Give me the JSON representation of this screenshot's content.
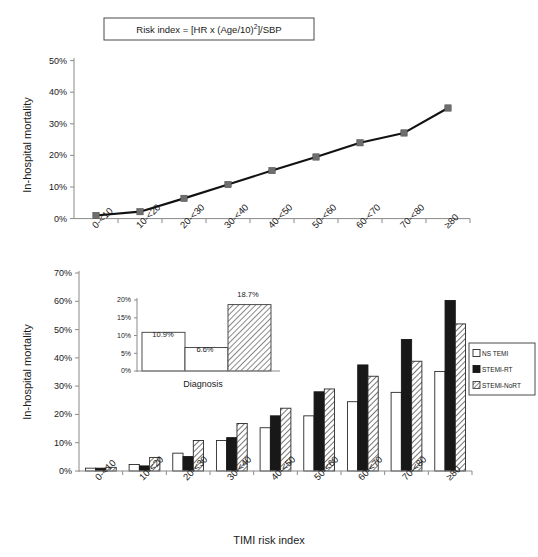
{
  "figure": {
    "title_box": "Risk index = [HR x (Age/10)2]/SBP",
    "formula_prefix": "Risk index = [HR x (Age/10)",
    "formula_exponent": "2",
    "formula_suffix": "]/SBP"
  },
  "chart_data": [
    {
      "type": "line",
      "title": "Risk index = [HR x (Age/10)2]/SBP",
      "xlabel": "",
      "ylabel": "In-hospital mortality",
      "ylim": [
        0,
        50
      ],
      "grid": false,
      "categories": [
        "0-<10",
        "10-<20",
        "20-<30",
        "30-<40",
        "40-<50",
        "50-<60",
        "60-<70",
        "70-<80",
        "≥80"
      ],
      "ytick_labels": [
        "0%",
        "10%",
        "20%",
        "30%",
        "40%",
        "50%"
      ],
      "ytick_values": [
        0,
        10,
        20,
        30,
        40,
        50
      ],
      "series": [
        {
          "name": "Overall in-hospital mortality",
          "values": [
            1.0,
            2.2,
            6.4,
            10.8,
            15.2,
            19.5,
            24.0,
            27.1,
            35.0
          ]
        }
      ],
      "marker": "square",
      "marker_color": "#6e6e6e",
      "line_color": "#121212"
    },
    {
      "type": "bar",
      "title": "",
      "xlabel": "TIMI risk index",
      "ylabel": "In-hospital mortality",
      "ylim": [
        0,
        70
      ],
      "grid": false,
      "legend_position": "right",
      "categories": [
        "0-<10",
        "10-<20",
        "20-<30",
        "30-<40",
        "40-<50",
        "50-<60",
        "60-<70",
        "70-<80",
        "≥80"
      ],
      "ytick_labels": [
        "0%",
        "10%",
        "20%",
        "30%",
        "40%",
        "50%",
        "60%",
        "70%"
      ],
      "ytick_values": [
        0,
        10,
        20,
        30,
        40,
        50,
        60,
        70
      ],
      "series": [
        {
          "name": "NS TEMI",
          "pattern": "solid-white",
          "values": [
            1.0,
            2.3,
            6.3,
            10.8,
            15.3,
            19.5,
            24.5,
            27.8,
            35.2
          ]
        },
        {
          "name": "STEMI-RT",
          "pattern": "solid-black",
          "values": [
            1.0,
            1.8,
            5.1,
            11.8,
            19.5,
            28.0,
            37.5,
            46.5,
            60.3
          ]
        },
        {
          "name": "STEMI-NoRT",
          "pattern": "hatched",
          "values": [
            1.3,
            4.8,
            10.8,
            16.8,
            22.2,
            29.0,
            33.5,
            38.8,
            52.0
          ]
        }
      ]
    },
    {
      "type": "bar",
      "title": "",
      "xlabel": "Diagnosis",
      "ylabel": "",
      "ylim": [
        0,
        20
      ],
      "grid": false,
      "inset": true,
      "categories": [
        "NS TEMI",
        "STEMI-RT",
        "STEMI-NoRT"
      ],
      "ytick_labels": [
        "0%",
        "5%",
        "10%",
        "15%",
        "20%"
      ],
      "ytick_values": [
        0,
        5,
        10,
        15,
        20
      ],
      "values": [
        10.9,
        6.6,
        18.7
      ],
      "data_labels": [
        "10.9%",
        "6.6%",
        "18.7%"
      ],
      "patterns": [
        "solid-white",
        "solid-white",
        "hatched"
      ]
    }
  ],
  "top_chart": {
    "ylabel": "In-hospital mortality",
    "yticks": [
      "0%",
      "10%",
      "20%",
      "30%",
      "40%",
      "50%"
    ],
    "categories": [
      "0-<10",
      "10-<20",
      "20-<30",
      "30-<40",
      "40-<50",
      "50-<60",
      "60-<70",
      "70-<80",
      "≥80"
    ]
  },
  "bottom_chart": {
    "ylabel": "In-hospital mortality",
    "xlabel": "TIMI risk index",
    "yticks": [
      "0%",
      "10%",
      "20%",
      "30%",
      "40%",
      "50%",
      "60%",
      "70%"
    ],
    "categories": [
      "0-<10",
      "10-<20",
      "20-<30",
      "30-<40",
      "40-<50",
      "50-<60",
      "60-<70",
      "70-<80",
      "≥80"
    ],
    "legend": [
      {
        "label": "NS TEMI",
        "pattern": "solid-white"
      },
      {
        "label": "STEMI-RT",
        "pattern": "solid-black"
      },
      {
        "label": "STEMI-NoRT",
        "pattern": "hatched"
      }
    ]
  },
  "inset_chart": {
    "xlabel": "Diagnosis",
    "yticks": [
      "0%",
      "5%",
      "10%",
      "15%",
      "20%"
    ],
    "bar_labels": [
      "10.9%",
      "6.6%",
      "18.7%"
    ]
  }
}
